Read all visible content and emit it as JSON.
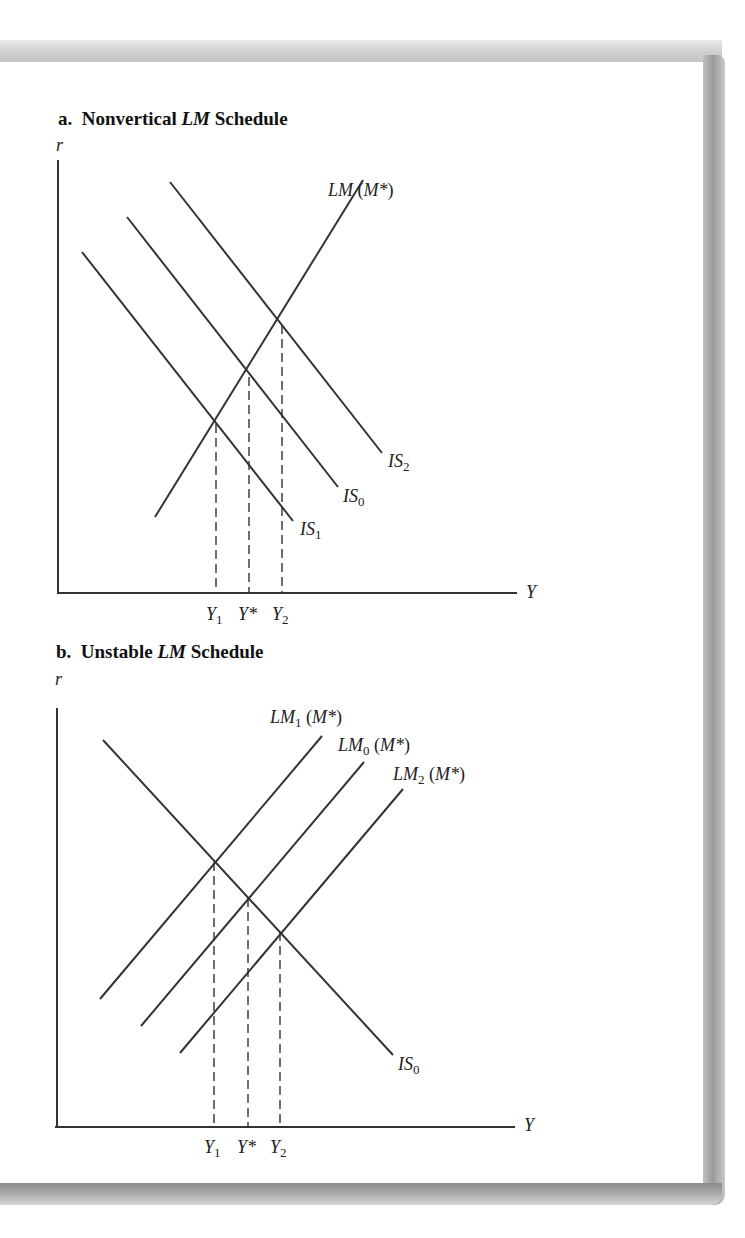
{
  "figure": {
    "panel_a": {
      "title_prefix": "a.",
      "title_pre": "Nonvertical ",
      "title_italic": "LM",
      "title_post": " Schedule",
      "y_axis_label": "r",
      "x_axis_label": "Y",
      "curves": {
        "lm": {
          "name": "LM",
          "arg_open": " (",
          "arg": "M*",
          "arg_close": ")"
        },
        "is2": {
          "name": "IS",
          "sub": "2"
        },
        "is0": {
          "name": "IS",
          "sub": "0"
        },
        "is1": {
          "name": "IS",
          "sub": "1"
        }
      },
      "x_ticks": [
        {
          "name": "Y",
          "sub": "1"
        },
        {
          "name": "Y*",
          "sub": ""
        },
        {
          "name": "Y",
          "sub": "2"
        }
      ]
    },
    "panel_b": {
      "title_prefix": "b.",
      "title_pre": "Unstable ",
      "title_italic": "LM",
      "title_post": " Schedule",
      "y_axis_label": "r",
      "x_axis_label": "Y",
      "curves": {
        "lm1": {
          "name": "LM",
          "sub": "1",
          "arg_open": " (",
          "arg": "M*",
          "arg_close": ")"
        },
        "lm0": {
          "name": "LM",
          "sub": "0",
          "arg_open": " (",
          "arg": "M*",
          "arg_close": ")"
        },
        "lm2": {
          "name": "LM",
          "sub": "2",
          "arg_open": " (",
          "arg": "M*",
          "arg_close": ")"
        },
        "is0": {
          "name": "IS",
          "sub": "0"
        }
      },
      "x_ticks": [
        {
          "name": "Y",
          "sub": "1"
        },
        {
          "name": "Y*",
          "sub": ""
        },
        {
          "name": "Y",
          "sub": "2"
        }
      ]
    },
    "colors": {
      "line": "#333333",
      "frame": "#a0a0a0",
      "background": "#ffffff"
    }
  }
}
